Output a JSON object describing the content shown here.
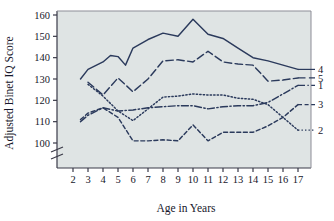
{
  "chart_data": {
    "type": "line",
    "title": "",
    "xlabel": "Age in Years",
    "ylabel": "Adjusted Binet IQ Score",
    "xlim": [
      2,
      17
    ],
    "ylim": [
      100,
      160
    ],
    "yticks": [
      100,
      110,
      120,
      130,
      140,
      150,
      160
    ],
    "xticks": [
      2,
      3,
      4,
      5,
      6,
      7,
      8,
      9,
      10,
      11,
      12,
      13,
      14,
      15,
      16,
      17
    ],
    "y_axis_break": true,
    "grid": false,
    "legend_position": "right-inline-labels",
    "background_color": "#dfe4e4",
    "line_color": "#2b3a5c",
    "x": [
      2.5,
      3,
      4,
      4.5,
      5,
      5.5,
      6,
      7,
      8,
      9,
      10,
      11,
      12,
      13,
      14,
      15,
      16,
      17
    ],
    "series": [
      {
        "name": "1",
        "label": "1",
        "style": "dashdot",
        "x": [
          2.5,
          3,
          4,
          5,
          6,
          7,
          8,
          9,
          10,
          11,
          12,
          13,
          14,
          15,
          16,
          17
        ],
        "values": [
          110,
          113,
          116.5,
          115,
          115.5,
          116.5,
          117,
          117.5,
          117.5,
          116,
          117,
          117.5,
          117.5,
          119,
          123,
          127
        ]
      },
      {
        "name": "2",
        "label": "2",
        "style": "dotted",
        "x": [
          3,
          4,
          5,
          6,
          7,
          8,
          9,
          10,
          11,
          12,
          13,
          14,
          15,
          16,
          17
        ],
        "values": [
          127.5,
          122,
          115,
          110.5,
          116,
          121.5,
          122,
          123,
          122.5,
          122.5,
          121,
          120.5,
          118,
          112,
          106
        ]
      },
      {
        "name": "3",
        "label": "3",
        "style": "dashed-short",
        "x": [
          2.5,
          3,
          4,
          5,
          6,
          7,
          8,
          9,
          10,
          11,
          12,
          13,
          14,
          15,
          16,
          17
        ],
        "values": [
          111,
          114,
          116.5,
          112,
          101,
          101,
          101.5,
          101,
          108.5,
          101,
          105,
          105,
          105,
          108,
          112,
          118
        ]
      },
      {
        "name": "4",
        "label": "4",
        "style": "solid",
        "x": [
          2.5,
          3,
          4,
          4.5,
          5,
          5.5,
          6,
          7,
          8,
          9,
          10,
          11,
          12,
          13,
          14,
          15,
          16,
          17
        ],
        "values": [
          130,
          134.5,
          138,
          141,
          140.5,
          136.5,
          144.5,
          148.5,
          151.5,
          150,
          158,
          151,
          149,
          144.5,
          140,
          138.5,
          136.5,
          134.5
        ]
      },
      {
        "name": "5",
        "label": "5",
        "style": "dashed-long",
        "x": [
          3,
          4,
          5,
          6,
          7,
          8,
          9,
          10,
          11,
          12,
          13,
          14,
          15,
          16,
          17
        ],
        "values": [
          128.5,
          122.5,
          130.5,
          124,
          130,
          138.5,
          139,
          138,
          143,
          138,
          137,
          136.5,
          129,
          129.5,
          130.5
        ]
      }
    ]
  },
  "labels": {
    "ylabel": "Adjusted Binet IQ Score",
    "xlabel": "Age in Years",
    "yticks": [
      "100",
      "110",
      "120",
      "130",
      "140",
      "150",
      "160"
    ],
    "xticks": [
      "2",
      "3",
      "4",
      "5",
      "6",
      "7",
      "8",
      "9",
      "10",
      "11",
      "12",
      "13",
      "14",
      "15",
      "16",
      "17"
    ],
    "series_tags": [
      "4",
      "5",
      "1",
      "3",
      "2"
    ]
  }
}
